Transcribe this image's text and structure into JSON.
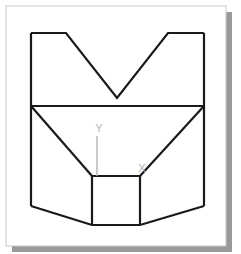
{
  "page": {
    "width": 241,
    "height": 254,
    "background": "#ffffff"
  },
  "card": {
    "name": "drawing-card",
    "x": 6,
    "y": 6,
    "width": 220,
    "height": 240,
    "fill": "#ffffff",
    "border_color": "#c9c9c9",
    "border_width": 1,
    "shadow_color": "#9a9a9a",
    "shadow_offset_x": 6,
    "shadow_offset_y": 6
  },
  "figure": {
    "name": "v-block-solid",
    "stroke_color": "#1a1a1a",
    "stroke_width": 2.2,
    "fill": "none"
  },
  "geometry": {
    "top_face_outline": {
      "name": "top-v-notch-face",
      "points": "31,33 66,33 117,98 168,33 204,33 204,106 31,106"
    },
    "mid_divider_line": {
      "name": "mid-horizontal-edge",
      "x1": 31,
      "y1": 106,
      "x2": 204,
      "y2": 106
    },
    "left_taper_edge": {
      "name": "left-taper-edge",
      "x1": 31,
      "y1": 106,
      "x2": 92,
      "y2": 176
    },
    "right_taper_edge": {
      "name": "right-taper-edge",
      "x1": 204,
      "y1": 106,
      "x2": 140,
      "y2": 176
    },
    "lower_body_outline": {
      "name": "lower-body-outline",
      "points": "31,106 31,206 92,225 140,225 204,206 204,106"
    },
    "inner_square": {
      "name": "inner-recess-square",
      "x": 92,
      "y": 176,
      "width": 48,
      "height": 49
    },
    "bottom_left_edge": {
      "name": "bottom-left-chamfer",
      "x1": 31,
      "y1": 206,
      "x2": 92,
      "y2": 225
    },
    "bottom_right_edge": {
      "name": "bottom-right-chamfer",
      "x1": 204,
      "y1": 206,
      "x2": 140,
      "y2": 225
    }
  },
  "annotations": {
    "color": "#b0b0b0",
    "font_size": 10,
    "items": [
      {
        "name": "axis-label-y",
        "label": "Y",
        "label_x": 99,
        "label_y": 132,
        "leader_x1": 97,
        "leader_y1": 136,
        "leader_x2": 97,
        "leader_y2": 176
      },
      {
        "name": "axis-label-x",
        "label": "X",
        "label_x": 142,
        "label_y": 172,
        "leader_x1": 0,
        "leader_y1": 0,
        "leader_x2": 0,
        "leader_y2": 0
      }
    ]
  }
}
